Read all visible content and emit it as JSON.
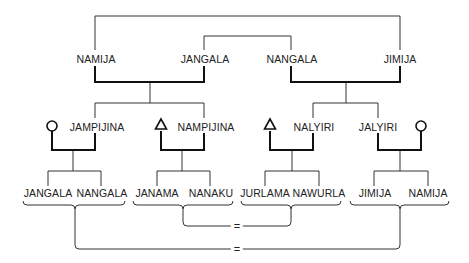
{
  "diagram": {
    "type": "kinship-diagram",
    "generation1": [
      {
        "id": "g1-namija",
        "label": "NAMIJA"
      },
      {
        "id": "g1-jangala",
        "label": "JANGALA"
      },
      {
        "id": "g1-nangala",
        "label": "NANGALA"
      },
      {
        "id": "g1-jimija",
        "label": "JIMIJA"
      }
    ],
    "generation2": [
      {
        "id": "g2-jampijina",
        "label": "JAMPIJINA",
        "spouse_symbol": "circle"
      },
      {
        "id": "g2-nampijina",
        "label": "NAMPIJINA",
        "spouse_symbol": "triangle"
      },
      {
        "id": "g2-nalyiri",
        "label": "NALYIRI",
        "spouse_symbol": "triangle"
      },
      {
        "id": "g2-jalyiri",
        "label": "JALYIRI",
        "spouse_symbol": "circle"
      }
    ],
    "generation3": [
      {
        "id": "g3-jangala",
        "label": "JANGALA"
      },
      {
        "id": "g3-nangala",
        "label": "NANGALA"
      },
      {
        "id": "g3-janama",
        "label": "JANAMA"
      },
      {
        "id": "g3-nanaku",
        "label": "NANAKU"
      },
      {
        "id": "g3-jurlama",
        "label": "JURLAMA"
      },
      {
        "id": "g3-nawurla",
        "label": "NAWURLA"
      },
      {
        "id": "g3-jimija",
        "label": "JIMIJA"
      },
      {
        "id": "g3-namija",
        "label": "NAMIJA"
      }
    ],
    "equivalences": [
      {
        "symbol": "=",
        "links": [
          "group-2",
          "group-3"
        ]
      },
      {
        "symbol": "=",
        "links": [
          "group-1",
          "group-4"
        ]
      }
    ]
  }
}
